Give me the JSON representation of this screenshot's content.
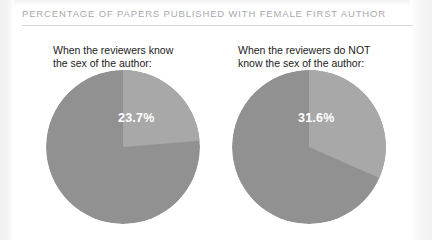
{
  "header": {
    "title": "PERCENTAGE OF PAPERS PUBLISHED WITH FEMALE FIRST AUTHOR",
    "rule_color": "#d8d8dc",
    "title_color": "#a9a9ad"
  },
  "colors": {
    "background": "#ffffff",
    "slice_highlight": "#a8a8a8",
    "slice_base": "#919191",
    "value_label": "#ffffff",
    "caption": "#1b1b1b"
  },
  "panels": [
    {
      "id": "reviewers-know",
      "caption": "When the reviewers know\nthe sex of the author:",
      "value_label": "23.7%"
    },
    {
      "id": "reviewers-do-not-know",
      "caption": "When the reviewers do NOT\nknow the sex of the author:",
      "value_label": "31.6%"
    }
  ],
  "chart_data": {
    "type": "pie",
    "title": "PERCENTAGE OF PAPERS PUBLISHED WITH FEMALE FIRST AUTHOR",
    "ylabel": "",
    "xlabel": "",
    "legend": "none",
    "grid": false,
    "charts": [
      {
        "name": "When the reviewers know the sex of the author:",
        "categories": [
          "Female first author",
          "Other"
        ],
        "values": [
          23.7,
          76.3
        ],
        "labels": [
          "23.7%",
          ""
        ],
        "colors": [
          "#a8a8a8",
          "#919191"
        ],
        "start_angle_deg": 0,
        "direction": "clockwise",
        "units": "percent"
      },
      {
        "name": "When the reviewers do NOT know the sex of the author:",
        "categories": [
          "Female first author",
          "Other"
        ],
        "values": [
          31.6,
          68.4
        ],
        "labels": [
          "31.6%",
          ""
        ],
        "colors": [
          "#a8a8a8",
          "#919191"
        ],
        "start_angle_deg": 0,
        "direction": "clockwise",
        "units": "percent"
      }
    ]
  }
}
